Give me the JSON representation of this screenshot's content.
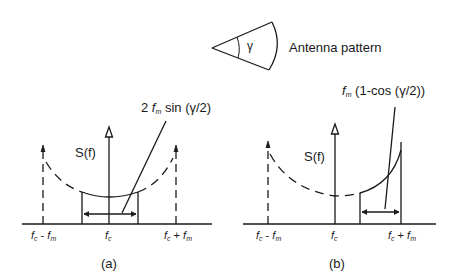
{
  "antenna": {
    "angle_symbol": "γ",
    "label": "Antenna pattern"
  },
  "panel_a": {
    "caption": "(a)",
    "axis_label": "S(f)",
    "annotation": {
      "prefix": "2 ",
      "f": "f",
      "sub": "m",
      "suffix": " sin (γ/2)"
    },
    "ticks": [
      {
        "f": "f",
        "sub1": "c",
        "mid": " - ",
        "f2": "f",
        "sub2": "m"
      },
      {
        "f": "f",
        "sub1": "c"
      },
      {
        "f": "f",
        "sub1": "c",
        "mid": " + ",
        "f2": "f",
        "sub2": "m"
      }
    ]
  },
  "panel_b": {
    "caption": "(b)",
    "axis_label": "S(f)",
    "annotation": {
      "f": "f",
      "sub": "m",
      "suffix": " (1-cos (γ/2))"
    },
    "ticks": [
      {
        "f": "f",
        "sub1": "c",
        "mid": " - ",
        "f2": "f",
        "sub2": "m"
      },
      {
        "f": "f",
        "sub1": "c"
      },
      {
        "f": "f",
        "sub1": "c",
        "mid": " + ",
        "f2": "f",
        "sub2": "m"
      }
    ]
  }
}
